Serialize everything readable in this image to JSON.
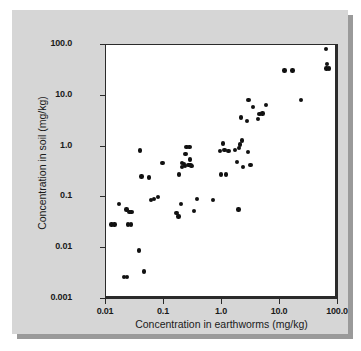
{
  "figure": {
    "panel_background": "#d6d6d6",
    "plot_background": "#ffffff",
    "axis_color": "#2b2b2b",
    "marker_color": "#111111"
  },
  "chart_data": {
    "type": "scatter",
    "title": "",
    "xlabel": "Concentration in earthworms (mg/kg)",
    "ylabel": "Concentration in soil (mg/kg)",
    "xscale": "log",
    "yscale": "log",
    "xlim": [
      0.01,
      100.0
    ],
    "ylim": [
      0.001,
      100.0
    ],
    "xticks": [
      0.01,
      0.1,
      1.0,
      10.0,
      100.0
    ],
    "xtick_labels": [
      "0.01",
      "0.1",
      "1.0",
      "10.0",
      "100.0"
    ],
    "yticks": [
      0.001,
      0.01,
      0.1,
      1.0,
      10.0,
      100.0
    ],
    "ytick_labels": [
      "0.001",
      "0.01",
      "0.1",
      "1.0",
      "10.0",
      "100.0"
    ],
    "grid": false,
    "legend": null,
    "series": [
      {
        "name": "samples",
        "marker": "circle",
        "color": "#111111",
        "points": [
          [
            0.013,
            0.028
          ],
          [
            0.0145,
            0.028
          ],
          [
            0.0175,
            0.07
          ],
          [
            0.0215,
            0.0026
          ],
          [
            0.024,
            0.0026
          ],
          [
            0.0235,
            0.055
          ],
          [
            0.025,
            0.028
          ],
          [
            0.0265,
            0.05
          ],
          [
            0.028,
            0.028
          ],
          [
            0.0285,
            0.05
          ],
          [
            0.039,
            0.0086
          ],
          [
            0.04,
            0.8
          ],
          [
            0.0425,
            0.245
          ],
          [
            0.047,
            0.0033
          ],
          [
            0.057,
            0.235
          ],
          [
            0.062,
            0.085
          ],
          [
            0.07,
            0.088
          ],
          [
            0.082,
            0.098
          ],
          [
            0.098,
            0.455
          ],
          [
            0.17,
            0.047
          ],
          [
            0.185,
            0.04
          ],
          [
            0.19,
            0.27
          ],
          [
            0.205,
            0.07
          ],
          [
            0.21,
            0.38
          ],
          [
            0.215,
            0.455
          ],
          [
            0.23,
            0.43
          ],
          [
            0.24,
            0.395
          ],
          [
            0.245,
            0.68
          ],
          [
            0.255,
            0.94
          ],
          [
            0.275,
            0.42
          ],
          [
            0.285,
            0.95
          ],
          [
            0.295,
            0.53
          ],
          [
            0.3,
            0.415
          ],
          [
            0.31,
            0.4
          ],
          [
            0.34,
            0.051
          ],
          [
            0.39,
            0.088
          ],
          [
            0.72,
            0.086
          ],
          [
            0.95,
            0.78
          ],
          [
            1.0,
            0.27
          ],
          [
            1.08,
            1.1
          ],
          [
            1.15,
            0.82
          ],
          [
            1.22,
            0.27
          ],
          [
            1.35,
            0.78
          ],
          [
            1.75,
            0.83
          ],
          [
            1.9,
            0.47
          ],
          [
            2.0,
            0.055
          ],
          [
            2.05,
            0.9
          ],
          [
            2.15,
            1.05
          ],
          [
            2.2,
            3.6
          ],
          [
            2.3,
            1.25
          ],
          [
            2.4,
            0.38
          ],
          [
            2.8,
            3.05
          ],
          [
            2.9,
            0.74
          ],
          [
            3.0,
            8.0
          ],
          [
            3.2,
            0.42
          ],
          [
            3.6,
            5.8
          ],
          [
            4.3,
            3.3
          ],
          [
            4.6,
            4.2
          ],
          [
            5.2,
            4.3
          ],
          [
            6.0,
            6.3
          ],
          [
            12.5,
            30.0
          ],
          [
            17.0,
            30.0
          ],
          [
            24.0,
            7.8
          ],
          [
            65.0,
            80.0
          ],
          [
            67.0,
            40.0
          ],
          [
            66.0,
            33.0
          ],
          [
            72.0,
            33.0
          ]
        ]
      }
    ]
  }
}
